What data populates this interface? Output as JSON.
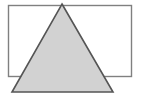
{
  "figure": {
    "width": 141,
    "height": 98,
    "background_color": "#ffffff",
    "shapes": [
      {
        "name": "rectangle",
        "type": "rect",
        "x": 8.5,
        "y": 5.5,
        "width": 123,
        "height": 71,
        "fill": "#ffffff",
        "stroke": "#808080",
        "stroke_width": 1.4,
        "z_order": 1
      },
      {
        "name": "triangle",
        "type": "polygon",
        "points": "62,4 113,92 12,92",
        "apex": [
          62,
          4
        ],
        "bottom_left": [
          12,
          92
        ],
        "bottom_right": [
          113,
          92
        ],
        "fill": "#d2d2d2",
        "stroke": "#555555",
        "stroke_width": 1.6,
        "z_order": 2
      }
    ]
  }
}
